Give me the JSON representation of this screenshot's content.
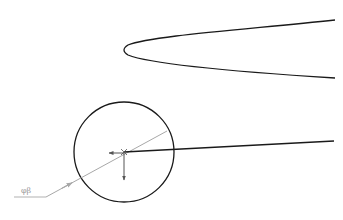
{
  "diagram": {
    "parabola": {
      "color": "#1a1a1a",
      "tip": [
        124,
        50
      ],
      "upper_end": [
        335,
        20
      ],
      "lower_end": [
        335,
        78
      ]
    },
    "circle": {
      "color": "#1a1a1a",
      "center": [
        124,
        152
      ],
      "radius": 50
    },
    "ray": {
      "color": "#1a1a1a",
      "from": [
        124,
        152
      ],
      "to": [
        334,
        141
      ]
    },
    "gray_line": {
      "color": "#a8a8a8",
      "from": [
        46,
        197
      ],
      "to": [
        167,
        131
      ]
    },
    "leader_line": {
      "color": "#a8a8a8",
      "from": [
        14,
        197
      ],
      "to": [
        46,
        197
      ]
    },
    "label": {
      "text": "φβ",
      "color": "#9a9a9a"
    },
    "arrows": {
      "color": "#555555"
    }
  }
}
